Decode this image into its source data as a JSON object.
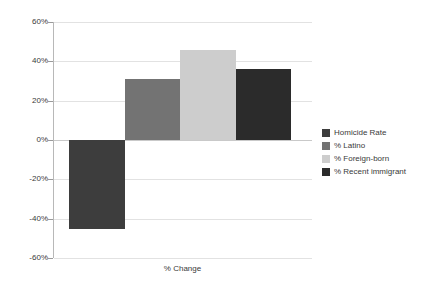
{
  "chart_data": {
    "type": "bar",
    "title": "",
    "subtitle": "",
    "xlabel": "% Change",
    "ylabel": "",
    "categories": [
      "Homicide Rate",
      "% Latino",
      "% Foreign-born",
      "% Recent immigrant"
    ],
    "values": [
      -45,
      31,
      46,
      36
    ],
    "series": [
      {
        "name": "% Change",
        "values": [
          -45,
          31,
          46,
          36
        ]
      }
    ],
    "ylim": [
      -60,
      60
    ],
    "y_ticks": [
      60,
      40,
      20,
      0,
      -20,
      -40,
      -60
    ],
    "y_tick_labels": [
      "60%",
      "40%",
      "20%",
      "0%",
      "-20%",
      "-40%",
      "-60%"
    ],
    "x_tick_labels": [],
    "grid": true,
    "legend_position": "right",
    "bar_colors": [
      "#3d3d3d",
      "#737373",
      "#cdcdcd",
      "#2b2b2b"
    ],
    "annotations": []
  },
  "axis": {
    "x_title": "% Change",
    "ticks": [
      {
        "label": "60%",
        "value": 60
      },
      {
        "label": "40%",
        "value": 40
      },
      {
        "label": "20%",
        "value": 20
      },
      {
        "label": "0%",
        "value": 0
      },
      {
        "label": "-20%",
        "value": -20
      },
      {
        "label": "-40%",
        "value": -40
      },
      {
        "label": "-60%",
        "value": -60
      }
    ]
  },
  "legend": {
    "items": [
      {
        "label": "Homicide Rate",
        "color": "#3d3d3d"
      },
      {
        "label": "% Latino",
        "color": "#737373"
      },
      {
        "label": "% Foreign-born",
        "color": "#cdcdcd"
      },
      {
        "label": "% Recent immigrant",
        "color": "#2b2b2b"
      }
    ]
  },
  "colors": {
    "background": "#ffffff",
    "gridline": "#e2e2e2",
    "zero_line": "#c9c9c9",
    "axis_line": "#b8b8b8",
    "text": "#3a3a3a"
  }
}
